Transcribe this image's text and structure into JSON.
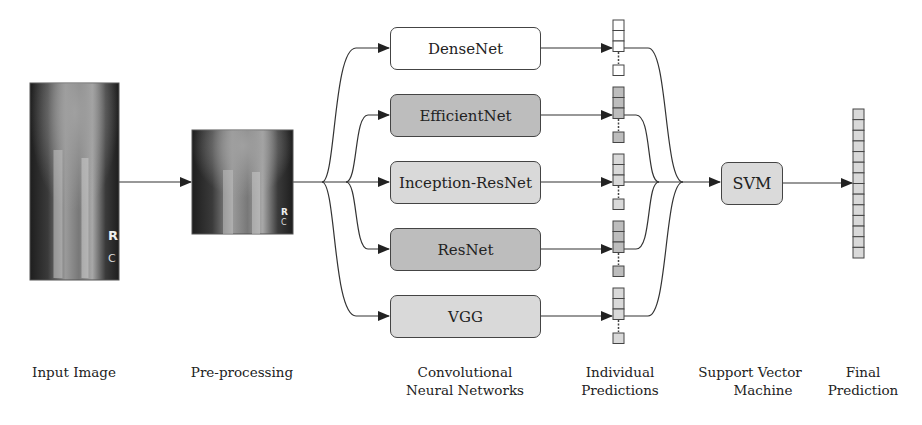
{
  "diagram": {
    "input_image": {
      "marker": "R",
      "marker_sub": "C"
    },
    "preprocessed_image": {
      "marker": "R",
      "marker_sub": "C"
    },
    "models": [
      {
        "name": "DenseNet",
        "fill": "#ffffff"
      },
      {
        "name": "EfficientNet",
        "fill": "#bdbdbd"
      },
      {
        "name": "Inception-ResNet",
        "fill": "#d9d9d9"
      },
      {
        "name": "ResNet",
        "fill": "#bdbdbd"
      },
      {
        "name": "VGG",
        "fill": "#d9d9d9"
      }
    ],
    "meta_classifier": {
      "name": "SVM",
      "fill": "#dadada"
    },
    "final_vector_cells": 14,
    "stage_labels": {
      "input": [
        "Input Image"
      ],
      "preprocessing": [
        "Pre-processing"
      ],
      "cnn": [
        "Convolutional",
        "Neural Networks"
      ],
      "individual": [
        "Individual",
        "Predictions"
      ],
      "svm": [
        "Support Vector",
        "Machine"
      ],
      "final": [
        "Final",
        "Prediction"
      ]
    }
  }
}
